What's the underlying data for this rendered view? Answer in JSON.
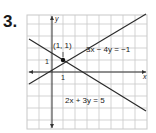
{
  "problem_number": "3.",
  "graph": {
    "axis_labels": {
      "x": "x",
      "y": "y"
    },
    "tick_labels": {
      "x": "1",
      "y": "1"
    },
    "intersection_label": "(1, 1)",
    "lines": [
      {
        "equation": "3x − 4y = −1"
      },
      {
        "equation": "2x + 3y = 5"
      }
    ],
    "colors": {
      "grid": "#c8c8c8",
      "axis": "#333333",
      "line": "#2a2a2a"
    }
  }
}
